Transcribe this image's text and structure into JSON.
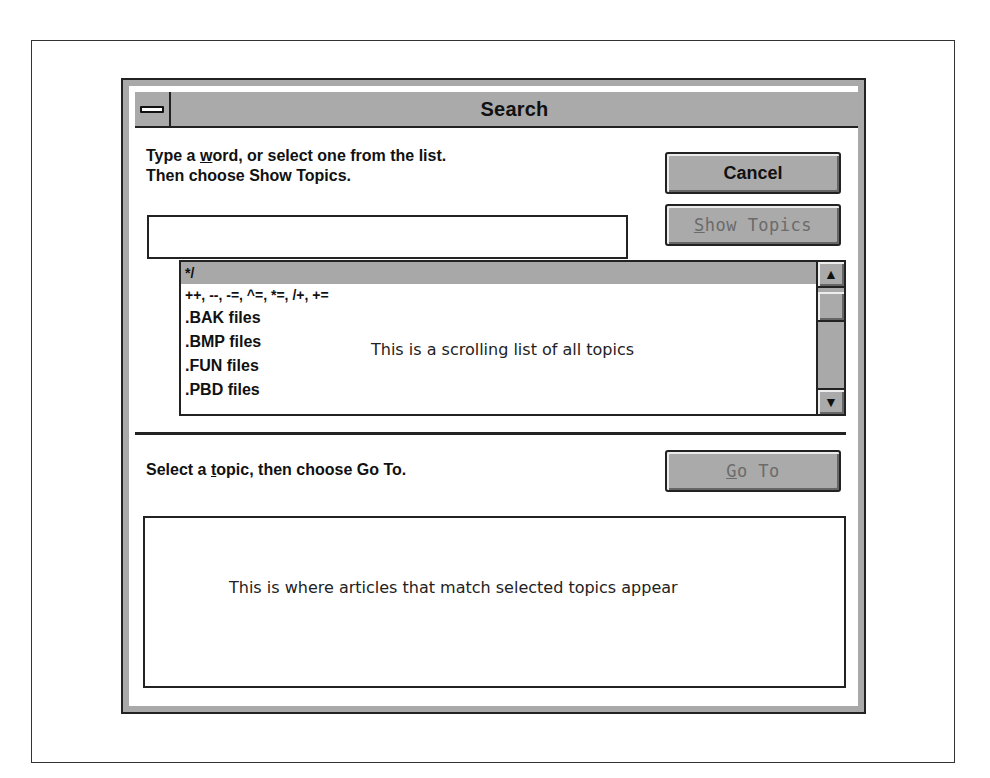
{
  "window": {
    "title": "Search",
    "system_menu_icon": "minus-bar-icon"
  },
  "search": {
    "instruction_line1_pre": "Type a ",
    "instruction_line1_accel": "w",
    "instruction_line1_post": "ord, or select one from the list.",
    "instruction_line2": "Then choose Show Topics.",
    "input_value": "",
    "input_placeholder": ""
  },
  "buttons": {
    "cancel": "Cancel",
    "show_topics_accel": "S",
    "show_topics_rest": "how Topics",
    "goto_accel": "G",
    "goto_rest": "o To"
  },
  "topic_list": {
    "items": [
      {
        "label": "*/",
        "selected": true
      },
      {
        "label": "++, --, -=, ^=, *=, /+, +=",
        "selected": false
      },
      {
        "label": ".BAK files",
        "selected": false
      },
      {
        "label": ".BMP files",
        "selected": false
      },
      {
        "label": ".FUN files",
        "selected": false
      },
      {
        "label": ".PBD files",
        "selected": false
      }
    ],
    "annotation": "This is a scrolling list of all topics",
    "scroll_up_icon": "▲",
    "scroll_down_icon": "▼"
  },
  "topics": {
    "instruction_pre": "Select a ",
    "instruction_accel": "t",
    "instruction_post": "opic, then choose Go To.",
    "annotation": "This is where articles that match selected topics appear"
  }
}
